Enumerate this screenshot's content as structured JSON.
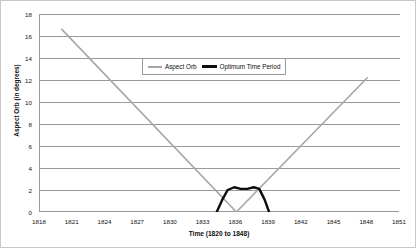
{
  "chart_data": {
    "type": "line",
    "title": "",
    "xlabel": "Time (1820 to 1848)",
    "ylabel": "Aspect Orb (in degrees)",
    "xlim": [
      1818,
      1851
    ],
    "ylim": [
      0,
      18
    ],
    "xticks": [
      1818,
      1821,
      1824,
      1827,
      1830,
      1833,
      1836,
      1839,
      1842,
      1845,
      1848,
      1851
    ],
    "yticks": [
      0,
      2,
      4,
      6,
      8,
      10,
      12,
      14,
      16,
      18
    ],
    "grid": "horizontal",
    "legend_position": "top-center",
    "series": [
      {
        "name": "Aspect Orb",
        "color": "#a6a6a6",
        "x": [
          1820.0,
          1836.0,
          1848.0
        ],
        "values": [
          16.6,
          0.0,
          12.2
        ]
      },
      {
        "name": "Optimum Time Period",
        "color": "#0d0d0d",
        "x": [
          1834.2,
          1834.7,
          1835.2,
          1835.8,
          1836.4,
          1837.0,
          1837.6,
          1838.1,
          1838.6,
          1839.0
        ],
        "values": [
          0.0,
          1.1,
          2.0,
          2.25,
          2.1,
          2.1,
          2.25,
          2.1,
          1.1,
          0.0
        ]
      }
    ]
  },
  "legend": {
    "entries": [
      {
        "label": "Aspect Orb"
      },
      {
        "label": "Optimum Time Period"
      }
    ]
  },
  "axes": {
    "x_title": "Time (1820 to 1848)",
    "y_title": "Aspect Orb (in degrees)"
  }
}
